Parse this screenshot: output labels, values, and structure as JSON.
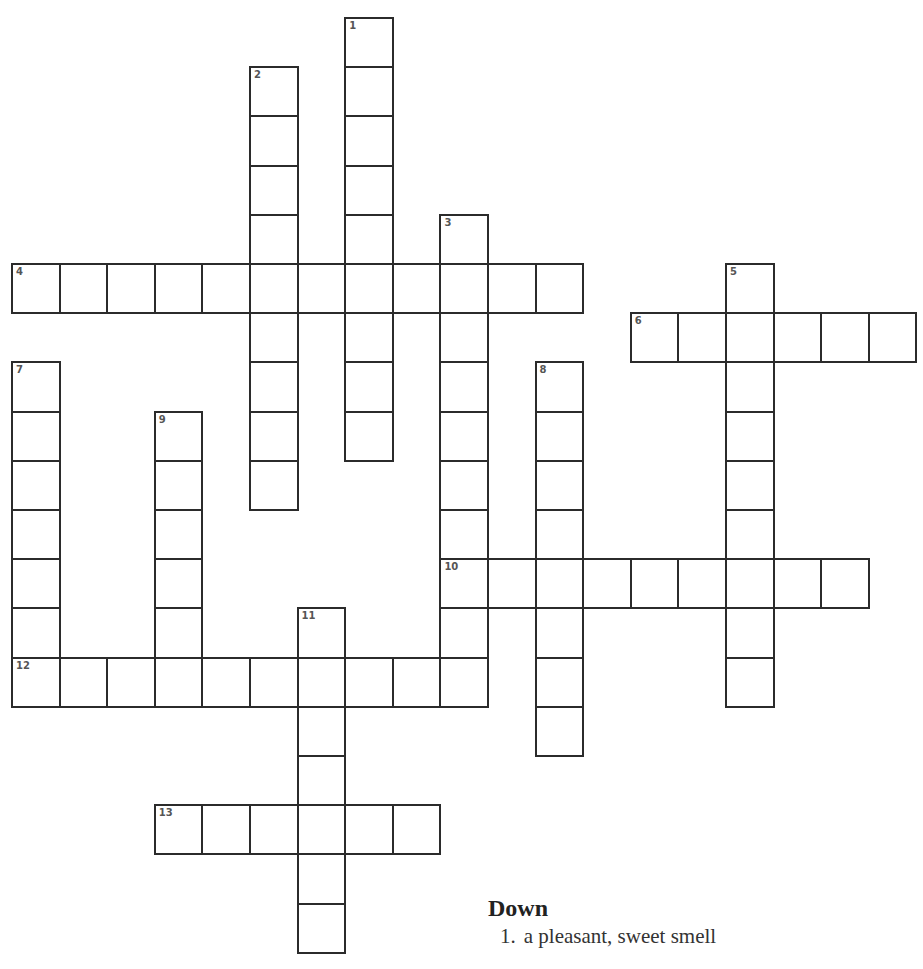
{
  "puzzle": {
    "cell_w": 47.6,
    "cell_h": 49.2,
    "origin_x": 12,
    "origin_y": 18,
    "words": [
      {
        "number": 1,
        "direction": "down",
        "row": 0,
        "col": 7,
        "length": 9
      },
      {
        "number": 2,
        "direction": "down",
        "row": 1,
        "col": 5,
        "length": 9
      },
      {
        "number": 3,
        "direction": "down",
        "row": 4,
        "col": 9,
        "length": 10
      },
      {
        "number": 4,
        "direction": "across",
        "row": 5,
        "col": 0,
        "length": 12
      },
      {
        "number": 5,
        "direction": "down",
        "row": 5,
        "col": 15,
        "length": 9
      },
      {
        "number": 6,
        "direction": "across",
        "row": 6,
        "col": 13,
        "length": 6
      },
      {
        "number": 7,
        "direction": "down",
        "row": 7,
        "col": 0,
        "length": 7
      },
      {
        "number": 8,
        "direction": "down",
        "row": 7,
        "col": 11,
        "length": 8
      },
      {
        "number": 9,
        "direction": "down",
        "row": 8,
        "col": 3,
        "length": 6
      },
      {
        "number": 10,
        "direction": "across",
        "row": 11,
        "col": 9,
        "length": 9
      },
      {
        "number": 11,
        "direction": "down",
        "row": 12,
        "col": 6,
        "length": 7
      },
      {
        "number": 12,
        "direction": "across",
        "row": 13,
        "col": 0,
        "length": 10
      },
      {
        "number": 13,
        "direction": "across",
        "row": 16,
        "col": 3,
        "length": 6
      }
    ]
  },
  "clues": {
    "down_heading": "Down",
    "down": [
      {
        "number": "1.",
        "text": "a pleasant, sweet smell"
      }
    ]
  }
}
